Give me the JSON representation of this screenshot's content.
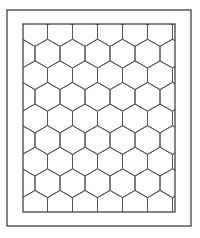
{
  "figure": {
    "colors": {
      "line": "#555555",
      "frame": "#444444",
      "background": "#ffffff"
    },
    "outer_frame": {
      "x": 7,
      "y": 10,
      "w": 184,
      "h": 216
    },
    "inner_frame": {
      "x": 23,
      "y": 24,
      "w": 152,
      "h": 188
    },
    "hex": {
      "width": 25,
      "side": 14.4,
      "origin_x": 23,
      "origin_y": 24
    }
  }
}
